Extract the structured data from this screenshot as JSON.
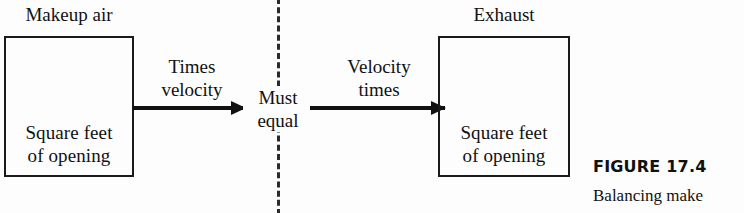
{
  "diagram": {
    "title_caption": {
      "figure_number": "FIGURE 17.4",
      "figure_text": "Balancing make"
    },
    "left": {
      "outside_caption": "Makeup air",
      "box_line1": "Square feet",
      "box_line2": "of opening"
    },
    "right": {
      "outside_caption": "Exhaust",
      "box_line1": "Square feet",
      "box_line2": "of opening"
    },
    "arrows": {
      "left_label_line1": "Times",
      "left_label_line2": "velocity",
      "right_label_line1": "Velocity",
      "right_label_line2": "times"
    },
    "center": {
      "line1": "Must",
      "line2": "equal"
    },
    "colors": {
      "ink": "#111111",
      "box_stroke": "#1a1a1a",
      "divider": "#2b2b2b",
      "background": "#fdfdfd"
    }
  }
}
